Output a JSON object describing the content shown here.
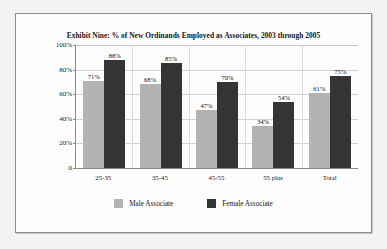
{
  "figure": {
    "frame_border_color": "#8d8d8d",
    "page_background": "#f4f3f1",
    "plot_background": "#fdfdfd"
  },
  "chart_data": {
    "type": "bar",
    "title": "Exhibit Nine: % of New Ordinands Employed as Associates, 2003 through 2005",
    "xlabel": "",
    "ylabel": "",
    "ylim": [
      0,
      100
    ],
    "yticks": [
      "0",
      "20%",
      "40%",
      "60%",
      "80%",
      "100%"
    ],
    "ytick_values": [
      0,
      20,
      40,
      60,
      80,
      100
    ],
    "grid": true,
    "legend_position": "bottom",
    "categories": [
      "25-35",
      "35-45",
      "45-55",
      "55 plus",
      "Total"
    ],
    "series": [
      {
        "name": "Male Associate",
        "color": "#b3b3b3",
        "values": [
          71,
          68,
          47,
          34,
          61
        ],
        "labels": [
          "71%",
          "68%",
          "47%",
          "34%",
          "61%"
        ]
      },
      {
        "name": "Female Associate",
        "color": "#343434",
        "values": [
          88,
          85,
          70,
          54,
          75
        ],
        "labels": [
          "88%",
          "85%",
          "70%",
          "54%",
          "75%"
        ]
      }
    ]
  }
}
